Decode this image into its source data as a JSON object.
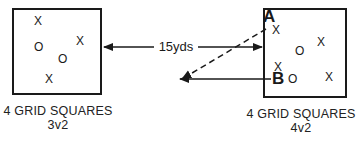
{
  "diagram": {
    "left_grid": {
      "label": "4 GRID SQUARES",
      "format": "3v2",
      "attackers": [
        {
          "x": 38,
          "y": 22
        },
        {
          "x": 79,
          "y": 42
        },
        {
          "x": 48,
          "y": 80
        }
      ],
      "defenders": [
        {
          "x": 38,
          "y": 48
        },
        {
          "x": 62,
          "y": 60
        }
      ]
    },
    "right_grid": {
      "label": "4 GRID SQUARES",
      "format": "4v2",
      "attackers": [
        {
          "x": 274,
          "y": 31
        },
        {
          "x": 320,
          "y": 43
        },
        {
          "x": 277,
          "y": 68
        },
        {
          "x": 328,
          "y": 78
        }
      ],
      "defenders": [
        {
          "x": 299,
          "y": 52
        },
        {
          "x": 291,
          "y": 80
        }
      ],
      "marker_a": "A",
      "marker_b": "B"
    },
    "distance_label": "15yds",
    "symbols": {
      "attacker": "X",
      "defender": "O"
    },
    "colors": {
      "line": "#1a1a1a",
      "background": "#ffffff"
    }
  }
}
